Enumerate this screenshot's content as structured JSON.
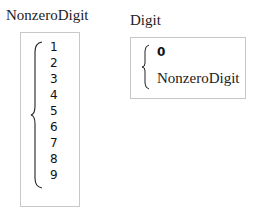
{
  "rules": [
    {
      "name": "NonzeroDigit",
      "alternatives": [
        "1",
        "2",
        "3",
        "4",
        "5",
        "6",
        "7",
        "8",
        "9"
      ]
    },
    {
      "name": "Digit",
      "alternatives": [
        "0",
        "NonzeroDigit"
      ]
    }
  ]
}
